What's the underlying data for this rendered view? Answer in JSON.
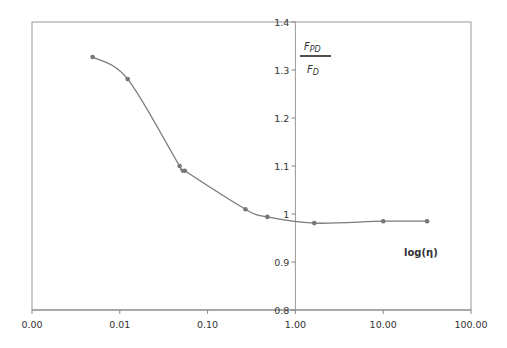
{
  "chart_data": {
    "type": "line",
    "title": "",
    "xlabel": "log(η)",
    "ylabel": "F_PD / F_D",
    "ylabel_parts": {
      "numerator": "F",
      "numerator_sub": "PD",
      "denominator": "F",
      "denominator_sub": "D"
    },
    "x_scale": "log",
    "xlim": [
      0.001,
      100
    ],
    "ylim": [
      0.8,
      1.4
    ],
    "x_ticks": [
      0.001,
      0.01,
      0.1,
      1,
      10,
      100
    ],
    "x_tick_labels": [
      "0.00",
      "0.01",
      "0.10",
      "1.00",
      "10.00",
      "100.00"
    ],
    "y_ticks": [
      0.8,
      0.9,
      1.0,
      1.1,
      1.2,
      1.3,
      1.4
    ],
    "y_tick_labels": [
      "0.8",
      "0.9",
      "1",
      "1.1",
      "1.2",
      "1.3",
      "1.4"
    ],
    "y_axis_crosses_x_at": 1,
    "grid": false,
    "legend": null,
    "series": [
      {
        "name": "F_PD/F_D",
        "color": "#7a7a7a",
        "marker": "circle",
        "smooth": true,
        "x": [
          0.0049,
          0.0123,
          0.048,
          0.055,
          0.27,
          0.48,
          1.64,
          10.0,
          31.6
        ],
        "y": [
          1.327,
          1.281,
          1.1,
          1.09,
          1.01,
          0.994,
          0.981,
          0.985,
          0.985
        ]
      }
    ]
  },
  "layout": {
    "plot_left": 32,
    "plot_right": 471,
    "plot_top": 22,
    "plot_bottom": 310,
    "yaxis_x": 295,
    "colors": {
      "frame": "#a0a0a0",
      "axis": "#888888",
      "line": "#7a7a7a",
      "marker": "#777777",
      "text": "#333333"
    }
  }
}
